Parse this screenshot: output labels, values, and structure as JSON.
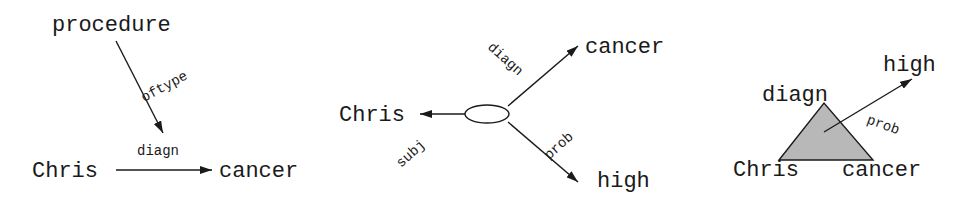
{
  "diagrams": [
    {
      "name": "graph-notation",
      "nodes": {
        "top": "procedure",
        "left": "Chris",
        "right": "cancer"
      },
      "edges": {
        "vertical": "oftype",
        "horizontal": "diagn"
      }
    },
    {
      "name": "hyperedge-notation",
      "nodes": {
        "left": "Chris",
        "top_right": "cancer",
        "bottom_right": "high"
      },
      "edges": {
        "left": "subj",
        "top_right": "diagn",
        "bottom_right": "prob"
      }
    },
    {
      "name": "triangle-notation",
      "nodes": {
        "apex": "diagn",
        "left": "Chris",
        "right": "cancer",
        "target": "high"
      },
      "edges": {
        "arrow": "prob"
      }
    }
  ],
  "colors": {
    "ink": "#1a1a1a",
    "triangle_fill": "#b8b8b8"
  }
}
